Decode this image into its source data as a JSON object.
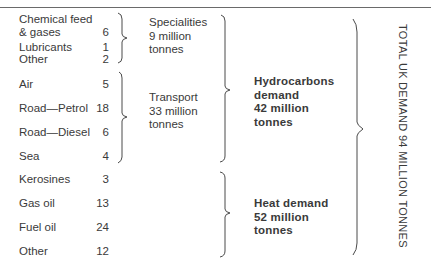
{
  "diagram": {
    "items": [
      {
        "label": "Chemical feed\n& gases",
        "value": "6",
        "group": "specialities"
      },
      {
        "label": "Lubricants",
        "value": "1",
        "group": "specialities"
      },
      {
        "label": "Other",
        "value": "2",
        "group": "specialities"
      },
      {
        "label": "Air",
        "value": "5",
        "group": "transport"
      },
      {
        "label": "Road—Petrol",
        "value": "18",
        "group": "transport"
      },
      {
        "label": "Road—Diesel",
        "value": "6",
        "group": "transport"
      },
      {
        "label": "Sea",
        "value": "4",
        "group": "transport"
      },
      {
        "label": "Kerosines",
        "value": "3",
        "group": "heat"
      },
      {
        "label": "Gas oil",
        "value": "13",
        "group": "heat"
      },
      {
        "label": "Fuel oil",
        "value": "24",
        "group": "heat"
      },
      {
        "label": "Other",
        "value": "12",
        "group": "heat"
      }
    ],
    "groups": {
      "specialities": {
        "label": "Specialities\n9 million\ntonnes"
      },
      "transport": {
        "label": "Transport\n33 million\ntonnes"
      }
    },
    "categories": {
      "hydrocarbons": {
        "label": "Hydrocarbons\ndemand\n42 million\ntonnes"
      },
      "heat": {
        "label": "Heat demand\n52 million\ntonnes"
      }
    },
    "total": {
      "label": "TOTAL UK DEMAND 94 MILLION TONNES"
    }
  }
}
